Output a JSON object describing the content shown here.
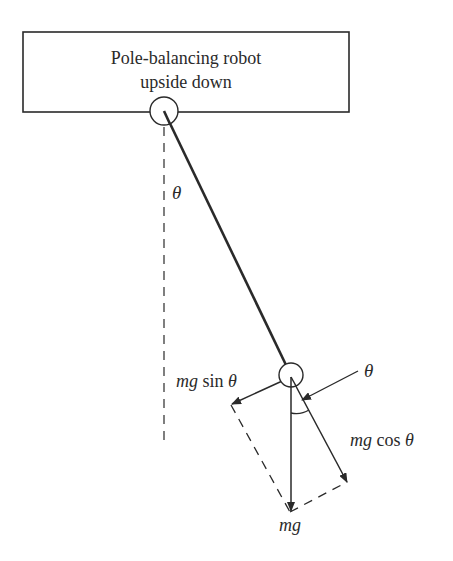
{
  "title_box": {
    "line1": "Pole-balancing robot",
    "line2": "upside down"
  },
  "labels": {
    "theta_top": "θ",
    "theta_right": "θ",
    "mg_sin_prefix": "mg",
    "mg_sin_func": " sin ",
    "mg_sin_theta": "θ",
    "mg_cos_prefix": "mg",
    "mg_cos_func": " cos ",
    "mg_cos_theta": "θ",
    "mg": "mg"
  },
  "colors": {
    "stroke": "#2a2a2a",
    "background": "#ffffff"
  }
}
